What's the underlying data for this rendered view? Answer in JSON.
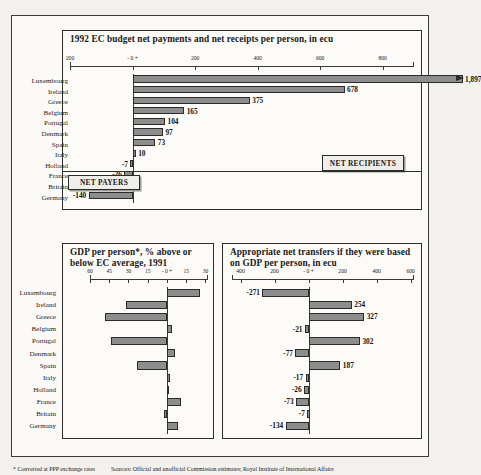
{
  "footnote": {
    "note": "* Converted at PPP exchange rates",
    "sources": "Sources: Official and unofficial Commission estimates; Royal Institute of International Affairs"
  },
  "callouts": {
    "net_recipients": "NET RECIPIENTS",
    "net_payers": "NET PAYERS"
  },
  "countries": [
    "Luxembourg",
    "Ireland",
    "Greece",
    "Belgium",
    "Portugal",
    "Denmark",
    "Spain",
    "Italy",
    "Holland",
    "France",
    "Britain",
    "Germany"
  ],
  "chart_data": [
    {
      "id": "budget",
      "type": "bar",
      "orientation": "horizontal",
      "title": "1992 EC budget net payments and net receipts per person, in ecu",
      "xlabel": "",
      "ylabel": "",
      "categories": [
        "Luxembourg",
        "Ireland",
        "Greece",
        "Belgium",
        "Portugal",
        "Denmark",
        "Spain",
        "Italy",
        "Holland",
        "France",
        "Britain",
        "Germany"
      ],
      "values": [
        1897,
        678,
        375,
        165,
        104,
        97,
        73,
        10,
        -7,
        -26,
        -52,
        -140
      ],
      "value_labels": [
        "1,897",
        "678",
        "375",
        "165",
        "104",
        "97",
        "73",
        "10",
        "-7",
        "-26",
        "-52",
        "-140"
      ],
      "xlim": [
        -200,
        900
      ],
      "ticks": [
        -200,
        0,
        200,
        400,
        600,
        800
      ],
      "tick_labels": [
        "200",
        "- 0 +",
        "200",
        "400",
        "600",
        "800"
      ],
      "axis_break": true,
      "axis_break_note": "Luxembourg bar extends past axis (1,897)",
      "grid": false
    },
    {
      "id": "gdp",
      "type": "bar",
      "orientation": "horizontal",
      "title": "GDP per person*, % above or below EC average, 1991",
      "xlabel": "",
      "ylabel": "",
      "categories": [
        "Luxembourg",
        "Ireland",
        "Greece",
        "Belgium",
        "Portugal",
        "Denmark",
        "Spain",
        "Italy",
        "Holland",
        "France",
        "Britain",
        "Germany"
      ],
      "values": [
        26,
        -32,
        -48,
        4,
        -44,
        6,
        -23,
        2,
        1,
        11,
        -2,
        9
      ],
      "xlim": [
        -60,
        32
      ],
      "ticks": [
        -60,
        -45,
        -30,
        -15,
        0,
        15,
        30
      ],
      "tick_labels": [
        "60",
        "45",
        "30",
        "15",
        "- 0 +",
        "15",
        "30"
      ],
      "grid": false
    },
    {
      "id": "transfers",
      "type": "bar",
      "orientation": "horizontal",
      "title": "Appropriate net transfers if they were based on GDP per person, in ecu",
      "xlabel": "",
      "ylabel": "",
      "categories": [
        "Luxembourg",
        "Ireland",
        "Greece",
        "Belgium",
        "Portugal",
        "Denmark",
        "Spain",
        "Italy",
        "Holland",
        "France",
        "Britain",
        "Germany"
      ],
      "values": [
        -271,
        254,
        327,
        -21,
        302,
        -77,
        187,
        -17,
        -26,
        -73,
        -7,
        -134
      ],
      "value_labels": [
        "-271",
        "254",
        "327",
        "-21",
        "302",
        "-77",
        "187",
        "-17",
        "-26",
        "-73",
        "-7",
        "-134"
      ],
      "xlim": [
        -450,
        620
      ],
      "ticks": [
        -400,
        -200,
        0,
        200,
        400,
        600
      ],
      "tick_labels": [
        "400",
        "200",
        "- 0 +",
        "200",
        "400",
        "600"
      ],
      "grid": false
    }
  ]
}
